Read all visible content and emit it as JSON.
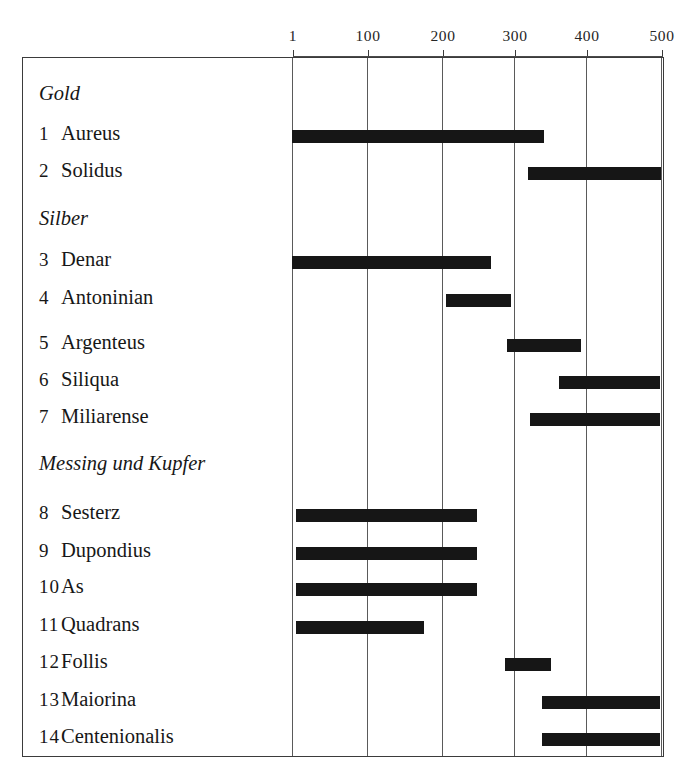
{
  "chart_data": {
    "type": "bar",
    "orientation": "horizontal-range",
    "title": "",
    "subtitle": "",
    "xlabel": "",
    "ylabel": "",
    "xlim": [
      1,
      500
    ],
    "axis_tick_labels": [
      "1",
      "100",
      "200",
      "300",
      "400",
      "500"
    ],
    "axis_tick_values": [
      1,
      100,
      200,
      300,
      400,
      500
    ],
    "grid": true,
    "grid_axis": "x",
    "legend": "none",
    "bar_color": "#161616",
    "groups": [
      {
        "label": "Gold",
        "items": [
          {
            "number": "1",
            "name": "Aureus",
            "start": 1,
            "end": 340
          },
          {
            "number": "2",
            "name": "Solidus",
            "start": 320,
            "end": 500
          }
        ]
      },
      {
        "label": "Silber",
        "items": [
          {
            "number": "3",
            "name": "Denar",
            "start": 1,
            "end": 268
          },
          {
            "number": "4",
            "name": "Antoninian",
            "start": 207,
            "end": 295
          },
          {
            "number": "5",
            "name": "Argenteus",
            "start": 290,
            "end": 395
          },
          {
            "number": "6",
            "name": "Siliqua",
            "start": 360,
            "end": 500
          },
          {
            "number": "7",
            "name": "Miliarense",
            "start": 320,
            "end": 500
          }
        ]
      },
      {
        "label": "Messing und Kupfer",
        "items": [
          {
            "number": "8",
            "name": "Sesterz",
            "start": 1,
            "end": 250
          },
          {
            "number": "9",
            "name": "Dupondius",
            "start": 1,
            "end": 250
          },
          {
            "number": "10",
            "name": "As",
            "start": 1,
            "end": 250
          },
          {
            "number": "11",
            "name": "Quadrans",
            "start": 1,
            "end": 178
          },
          {
            "number": "12",
            "name": "Follis",
            "start": 288,
            "end": 350
          },
          {
            "number": "13",
            "name": "Maiorina",
            "start": 337,
            "end": 500
          },
          {
            "number": "14",
            "name": "Centenionalis",
            "start": 337,
            "end": 500
          }
        ]
      }
    ]
  },
  "axis": {
    "ticks": [
      {
        "label": "1",
        "x": 293
      },
      {
        "label": "100",
        "x": 368
      },
      {
        "label": "200",
        "x": 443
      },
      {
        "label": "300",
        "x": 515
      },
      {
        "label": "400",
        "x": 587
      },
      {
        "label": "500",
        "x": 662
      }
    ]
  },
  "rows": [
    {
      "kind": "group",
      "label": "Gold",
      "y": 82
    },
    {
      "kind": "item",
      "number": "1",
      "name": "Aureus",
      "y": 122,
      "bar": {
        "x": 293,
        "w": 252
      }
    },
    {
      "kind": "item",
      "number": "2",
      "name": "Solidus",
      "y": 159,
      "bar": {
        "x": 529,
        "w": 133
      }
    },
    {
      "kind": "group",
      "label": "Silber",
      "y": 207
    },
    {
      "kind": "item",
      "number": "3",
      "name": "Denar",
      "y": 248,
      "bar": {
        "x": 293,
        "w": 199
      }
    },
    {
      "kind": "item",
      "number": "4",
      "name": "Antoninian",
      "y": 286,
      "bar": {
        "x": 447,
        "w": 65
      }
    },
    {
      "kind": "item",
      "number": "5",
      "name": "Argenteus",
      "y": 331,
      "bar": {
        "x": 508,
        "w": 74
      }
    },
    {
      "kind": "item",
      "number": "6",
      "name": "Siliqua",
      "y": 368,
      "bar": {
        "x": 560,
        "w": 101
      }
    },
    {
      "kind": "item",
      "number": "7",
      "name": "Miliarense",
      "y": 405,
      "bar": {
        "x": 531,
        "w": 130
      }
    },
    {
      "kind": "group",
      "label": "Messing und Kupfer",
      "y": 452
    },
    {
      "kind": "item",
      "number": "8",
      "name": "Sesterz",
      "y": 501,
      "bar": {
        "x": 297,
        "w": 181
      }
    },
    {
      "kind": "item",
      "number": "9",
      "name": "Dupondius",
      "y": 539,
      "bar": {
        "x": 297,
        "w": 181
      }
    },
    {
      "kind": "item",
      "number": "10",
      "name": "As",
      "y": 575,
      "bar": {
        "x": 297,
        "w": 181
      }
    },
    {
      "kind": "item",
      "number": "11",
      "name": "Quadrans",
      "y": 613,
      "bar": {
        "x": 297,
        "w": 128
      }
    },
    {
      "kind": "item",
      "number": "12",
      "name": "Follis",
      "y": 650,
      "bar": {
        "x": 506,
        "w": 46
      }
    },
    {
      "kind": "item",
      "number": "13",
      "name": "Maiorina",
      "y": 688,
      "bar": {
        "x": 543,
        "w": 118
      }
    },
    {
      "kind": "item",
      "number": "14",
      "name": "Centenionalis",
      "y": 725,
      "bar": {
        "x": 543,
        "w": 118
      }
    }
  ]
}
